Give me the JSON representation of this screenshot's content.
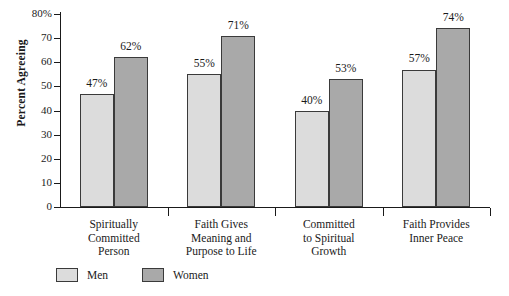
{
  "chart_data": {
    "type": "bar",
    "title": "",
    "subtitle": "",
    "xlabel": "",
    "ylabel": "Percent Agreeing",
    "ylim": [
      0,
      80
    ],
    "y_tick_labels": [
      "80%",
      "70",
      "60",
      "50",
      "40",
      "30",
      "20",
      "10",
      "0"
    ],
    "y_tick_values": [
      80,
      70,
      60,
      50,
      40,
      30,
      20,
      10,
      0
    ],
    "grid": false,
    "legend_position": "bottom-left",
    "categories": [
      "Spiritually Committed Person",
      "Faith Gives Meaning and Purpose to Life",
      "Committed to Spiritual Growth",
      "Faith Provides Inner Peace"
    ],
    "category_label_lines": [
      [
        "Spiritually",
        "Committed",
        "Person"
      ],
      [
        "Faith Gives",
        "Meaning and",
        "Purpose to Life"
      ],
      [
        "Committed",
        "to Spiritual",
        "Growth"
      ],
      [
        "Faith Provides",
        "Inner Peace"
      ]
    ],
    "series": [
      {
        "name": "Men",
        "color": "#dcdcdc",
        "values": [
          47,
          55,
          40,
          57
        ],
        "value_labels": [
          "47%",
          "55%",
          "40%",
          "57%"
        ]
      },
      {
        "name": "Women",
        "color": "#a9a9a9",
        "values": [
          62,
          71,
          53,
          74
        ],
        "value_labels": [
          "62%",
          "71%",
          "53%",
          "74%"
        ]
      }
    ]
  },
  "legend": {
    "items": [
      {
        "label": "Men",
        "color": "#dcdcdc"
      },
      {
        "label": "Women",
        "color": "#a9a9a9"
      }
    ]
  },
  "colors": {
    "men_bar": "#dcdcdc",
    "women_bar": "#a9a9a9",
    "bar_outline": "#3a3a3a",
    "axis": "#1a1a1a",
    "text": "#1a1a1a",
    "background": "#ffffff"
  }
}
